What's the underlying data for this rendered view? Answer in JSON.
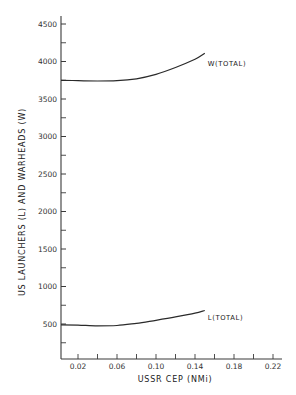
{
  "chart_data": {
    "type": "line",
    "title": "",
    "xlabel": "USSR CEP (NMi)",
    "ylabel": "US LAUNCHERS (L) AND WARHEADS (W)",
    "xlim": [
      0.0,
      0.23
    ],
    "ylim": [
      0,
      4600
    ],
    "x_ticks_major": [
      0.02,
      0.06,
      0.1,
      0.14,
      0.18,
      0.22
    ],
    "x_tick_labels": [
      "0.02",
      "0.06",
      "0.10",
      "0.14",
      "0.18",
      "0.22"
    ],
    "x_ticks_minor": [
      0.04,
      0.08,
      0.12,
      0.16,
      0.2
    ],
    "y_ticks_major": [
      500,
      1000,
      1500,
      2000,
      2500,
      3000,
      3500,
      4000,
      4500
    ],
    "y_tick_labels": [
      "500",
      "1000",
      "1500",
      "2000",
      "2500",
      "3000",
      "3500",
      "4000",
      "4500"
    ],
    "y_ticks_minor": [
      250,
      750,
      1250,
      1750,
      2250,
      2750,
      3250,
      3750,
      4250
    ],
    "grid": false,
    "legend": "inline labels at line ends",
    "series": [
      {
        "name": "W(TOTAL)",
        "x": [
          0.0,
          0.02,
          0.04,
          0.06,
          0.08,
          0.1,
          0.12,
          0.14,
          0.15
        ],
        "values": [
          3750,
          3745,
          3740,
          3745,
          3770,
          3830,
          3920,
          4030,
          4110
        ]
      },
      {
        "name": "L(TOTAL)",
        "x": [
          0.0,
          0.02,
          0.04,
          0.06,
          0.08,
          0.1,
          0.12,
          0.14,
          0.15
        ],
        "values": [
          490,
          485,
          475,
          480,
          510,
          550,
          595,
          645,
          680
        ]
      }
    ]
  }
}
